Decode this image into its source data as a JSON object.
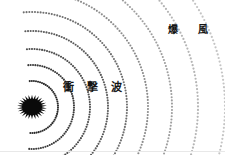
{
  "figure": {
    "title_visible": false,
    "background_color": "#ffffff",
    "width": 225,
    "height": 155
  },
  "labels": {
    "shockwave": "衝撃波",
    "blast_wind": "爆風"
  },
  "explosion": {
    "name": "explosion-burst",
    "center_x": 32,
    "center_y": 107,
    "radius": 15,
    "spike_count": 26,
    "color": "#0a0a0a"
  },
  "chart_data": {
    "type": "scatter",
    "title": "",
    "xlabel": "",
    "ylabel": "",
    "grid": false,
    "legend": "none",
    "origin": {
      "x": 32,
      "y": 107
    },
    "rings": [
      {
        "index": 1,
        "radius": 26,
        "color": "#2b2b2b",
        "dot_size": 1.05,
        "dot_gap_deg": 4.6
      },
      {
        "index": 2,
        "radius": 42,
        "color": "#3a3a3a",
        "dot_size": 1.05,
        "dot_gap_deg": 3.2
      },
      {
        "index": 3,
        "radius": 58,
        "color": "#4a4a4a",
        "dot_size": 1.05,
        "dot_gap_deg": 2.5
      },
      {
        "index": 4,
        "radius": 76,
        "color": "#5a5a5a",
        "dot_size": 1.05,
        "dot_gap_deg": 2.0
      },
      {
        "index": 5,
        "radius": 95,
        "color": "#6f6f6f",
        "dot_size": 1.05,
        "dot_gap_deg": 1.7
      },
      {
        "index": 6,
        "radius": 116,
        "color": "#8c8c8c",
        "dot_size": 1.05,
        "dot_gap_deg": 1.5
      },
      {
        "index": 7,
        "radius": 140,
        "color": "#9e9e9e",
        "dot_size": 1.05,
        "dot_gap_deg": 1.3
      },
      {
        "index": 8,
        "radius": 166,
        "color": "#b5b5b5",
        "dot_size": 1.1,
        "dot_gap_deg": 1.2
      },
      {
        "index": 9,
        "radius": 193,
        "color": "#c4c4c4",
        "dot_size": 1.1,
        "dot_gap_deg": 1.1
      },
      {
        "index": 10,
        "radius": 222,
        "color": "#d0d0d0",
        "dot_size": 1.15,
        "dot_gap_deg": 1.0
      }
    ],
    "annotations": [
      {
        "text": "衝撃波",
        "x": 63,
        "y": 88,
        "color": "#141414"
      },
      {
        "text": "爆風",
        "x": 168,
        "y": 30,
        "color": "#141414"
      }
    ]
  },
  "footer": {
    "rule_color": "#e8e8e8"
  }
}
